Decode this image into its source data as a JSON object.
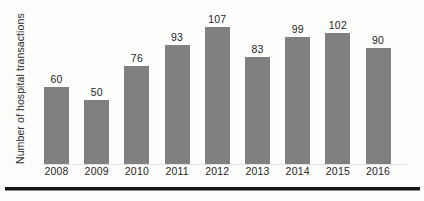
{
  "chart_data": {
    "type": "bar",
    "title": "",
    "subtitle": "",
    "xlabel": "",
    "ylabel": "Number of hospital transactions",
    "categories": [
      "2008",
      "2009",
      "2010",
      "2011",
      "2012",
      "2013",
      "2014",
      "2015",
      "2016"
    ],
    "values": [
      60,
      50,
      76,
      93,
      107,
      83,
      99,
      102,
      90
    ],
    "labels": [
      "60",
      "50",
      "76",
      "93",
      "107",
      "83",
      "99",
      "102",
      "90"
    ],
    "series": [
      {
        "name": "Number of hospital transactions",
        "values": [
          60,
          50,
          76,
          93,
          107,
          83,
          99,
          102,
          90
        ]
      }
    ],
    "ylim": [
      0,
      123
    ],
    "grid": false,
    "legend": false,
    "legend_position": "none",
    "data_labels": true,
    "bar_color": "#808080",
    "background_color": "#fdfdfc",
    "axis_label_color": "#1f1f1f"
  },
  "footer": {
    "rule_color": "#16161a"
  }
}
